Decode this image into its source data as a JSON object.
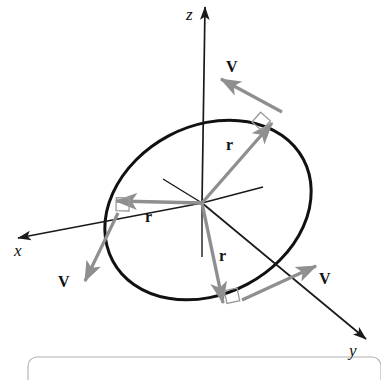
{
  "figure": {
    "background_color": "#ffffff",
    "axis_color": "#1a1a1a",
    "vector_color": "#8c8c8c",
    "circle_color": "#111111",
    "frame_color": "#b0b0b0",
    "axes": [
      {
        "name": "z-axis",
        "label": "z",
        "label_x": 186,
        "label_y": 20,
        "tip_x": 205,
        "tip_y": 7,
        "tail_x": 202,
        "tail_y": 203
      },
      {
        "name": "x-axis",
        "label": "x",
        "label_x": 14,
        "label_y": 256,
        "tip_x": 18,
        "tip_y": 238,
        "tail_x": 202,
        "tail_y": 203
      },
      {
        "name": "y-axis",
        "label": "y",
        "label_x": 349,
        "label_y": 356,
        "tip_x": 366,
        "tip_y": 339,
        "tail_x": 202,
        "tail_y": 203
      }
    ],
    "negative_axis_stubs": [
      {
        "name": "negative-x-stub",
        "x1": 202,
        "y1": 203,
        "x2": 163,
        "y2": 179
      },
      {
        "name": "negative-y-stub",
        "x1": 202,
        "y1": 203,
        "x2": 263,
        "y2": 187
      },
      {
        "name": "negative-z-stub",
        "x1": 202,
        "y1": 203,
        "x2": 202,
        "y2": 257
      }
    ],
    "orbit": {
      "name": "circular-path",
      "center_x": 208,
      "center_y": 210,
      "radius_x": 108,
      "radius_y": 84,
      "rotation_deg": -28,
      "stroke_width": 3
    },
    "radius_vectors": [
      {
        "name": "radius-vector-upper-right",
        "label": "r",
        "label_x": 226,
        "label_y": 150,
        "x1": 202,
        "y1": 203,
        "x2": 272,
        "y2": 123
      },
      {
        "name": "radius-vector-left",
        "label": "r",
        "label_x": 145,
        "label_y": 222,
        "x1": 202,
        "y1": 203,
        "x2": 116,
        "y2": 201
      },
      {
        "name": "radius-vector-lower",
        "label": "r",
        "label_x": 219,
        "label_y": 261,
        "x1": 202,
        "y1": 203,
        "x2": 223,
        "y2": 303
      }
    ],
    "velocity_vectors": [
      {
        "name": "velocity-vector-top",
        "label": "V",
        "label_x": 226,
        "label_y": 72,
        "x1": 282,
        "y1": 112,
        "x2": 221,
        "y2": 79
      },
      {
        "name": "velocity-vector-left",
        "label": "V",
        "label_x": 58,
        "label_y": 287,
        "x1": 118,
        "y1": 213,
        "x2": 85,
        "y2": 281
      },
      {
        "name": "velocity-vector-right",
        "label": "V",
        "label_x": 319,
        "label_y": 284,
        "x1": 242,
        "y1": 300,
        "x2": 316,
        "y2": 266
      }
    ],
    "right_angle_markers": [
      {
        "name": "right-angle-marker-top",
        "cx": 252,
        "cy": 122
      },
      {
        "name": "right-angle-marker-left",
        "cx": 129,
        "cy": 211
      },
      {
        "name": "right-angle-marker-bottom",
        "cx": 237,
        "cy": 288
      }
    ],
    "frame": {
      "name": "caption-frame",
      "x": 28,
      "y": 357,
      "width": 353,
      "height": 40,
      "corner_radius": 9
    }
  }
}
